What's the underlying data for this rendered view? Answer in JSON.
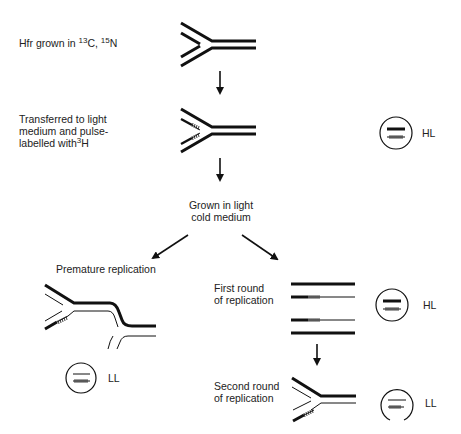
{
  "diagram": {
    "title": "",
    "steps": {
      "step1": {
        "label_prefix": "Hfr grown in ",
        "iso1_sup": "13",
        "iso1": "C, ",
        "iso2_sup": "15",
        "iso2": "N"
      },
      "step2": {
        "line1": "Transferred to light",
        "line2": "medium and pulse-",
        "line3_prefix": "labelled with",
        "iso_sup": "3",
        "iso": "H"
      },
      "step3": {
        "line1": "Grown in light",
        "line2": "cold medium"
      },
      "branch_left": {
        "label": "Premature replication"
      },
      "branch_right_1": {
        "line1": "First round",
        "line2": "of replication"
      },
      "branch_right_2": {
        "line1": "Second round",
        "line2": "of replication"
      }
    },
    "density_bands": [
      {
        "id": "after-pulse",
        "label": "HL"
      },
      {
        "id": "premature",
        "label": "LL"
      },
      {
        "id": "first-round",
        "label": "HL"
      },
      {
        "id": "second-round",
        "label": "LL"
      }
    ],
    "legend_colors": {
      "heavy_strand": "#111111",
      "light_strand": "#222222",
      "tritium_label": "#111111"
    }
  }
}
